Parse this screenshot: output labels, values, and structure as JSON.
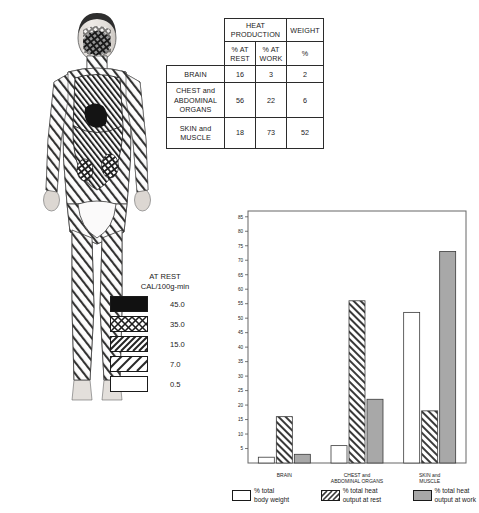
{
  "figure": {
    "name": "human-body-heat-map",
    "alt_label": "Human figure shaded by regional heat production"
  },
  "table": {
    "corner_label": "",
    "group_headers": [
      {
        "label": "HEAT PRODUCTION",
        "span": 2
      },
      {
        "label": "WEIGHT",
        "span": 1
      }
    ],
    "sub_headers": [
      "% AT REST",
      "% AT WORK",
      "%"
    ],
    "rows": [
      {
        "label": "BRAIN",
        "rest": "16",
        "work": "3",
        "weight": "2"
      },
      {
        "label": "CHEST and ABDOMINAL ORGANS",
        "rest": "56",
        "work": "22",
        "weight": "6"
      },
      {
        "label": "SKIN and MUSCLE",
        "rest": "18",
        "work": "73",
        "weight": "52"
      }
    ]
  },
  "rest_key": {
    "title_line1": "AT REST",
    "title_line2": "CAL/100g-min",
    "entries": [
      {
        "value": "45.0",
        "pattern": "solid-black"
      },
      {
        "value": "35.0",
        "pattern": "cross-hatch"
      },
      {
        "value": "15.0",
        "pattern": "dense-diagonal"
      },
      {
        "value": "7.0",
        "pattern": "sparse-diagonal"
      },
      {
        "value": "0.5",
        "pattern": "blank-white"
      }
    ]
  },
  "chart_data": {
    "type": "bar",
    "title": "",
    "xlabel": "",
    "ylabel": "",
    "ylim": [
      0,
      87
    ],
    "yticks": [
      5,
      10,
      15,
      20,
      25,
      30,
      35,
      40,
      45,
      50,
      55,
      60,
      65,
      70,
      75,
      80,
      85
    ],
    "ytick_labels": [
      "5",
      "10",
      "15",
      "20",
      "25",
      "30",
      "35",
      "40",
      "45",
      "50",
      "55",
      "60",
      "65",
      "70",
      "75",
      "80",
      "85"
    ],
    "grid": false,
    "legend_position": "bottom",
    "categories": [
      "BRAIN",
      "CHEST and ABDOMINAL ORGANS",
      "SKIN and MUSCLE"
    ],
    "category_lines": [
      [
        "BRAIN"
      ],
      [
        "CHEST and",
        "ABDOMINAL ORGANS"
      ],
      [
        "SKIN and",
        "MUSCLE"
      ]
    ],
    "series": [
      {
        "name": "% total body weight",
        "pattern": "white",
        "values": [
          2,
          6,
          52
        ]
      },
      {
        "name": "% total heat output at rest",
        "pattern": "hatched",
        "values": [
          16,
          56,
          18
        ]
      },
      {
        "name": "% total heat output at work",
        "pattern": "gray",
        "values": [
          3,
          22,
          73
        ]
      }
    ]
  },
  "chart_legend": [
    {
      "line1": "% total",
      "line2": "body weight",
      "pattern": "white"
    },
    {
      "line1": "% total heat",
      "line2": "output at rest",
      "pattern": "hatched"
    },
    {
      "line1": "% total heat",
      "line2": "output at work",
      "pattern": "gray"
    }
  ],
  "colors": {
    "ink": "#1a1a1a",
    "gray_bar": "#a8a8a8",
    "frame": "#555555",
    "black_swatch": "#111111"
  }
}
